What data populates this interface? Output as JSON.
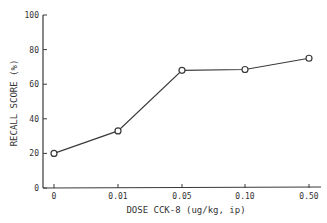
{
  "chart_data": {
    "type": "line",
    "title": "",
    "xlabel": "DOSE CCK-8 (ug/kg, ip)",
    "ylabel": "RECALL SCORE (%)",
    "categories": [
      "0",
      "0.01",
      "0.05",
      "0.10",
      "0.50"
    ],
    "series": [
      {
        "name": "Recall score",
        "values": [
          20,
          33,
          68,
          68.5,
          75
        ],
        "marker": "open-circle"
      }
    ],
    "ylim": [
      0,
      100
    ],
    "yticks": [
      0,
      20,
      40,
      60,
      80,
      100
    ],
    "grid": false,
    "legend": null
  },
  "colors": {
    "line": "#3a3a3a",
    "axis": "#3a3a3a",
    "background": "#ffffff"
  }
}
